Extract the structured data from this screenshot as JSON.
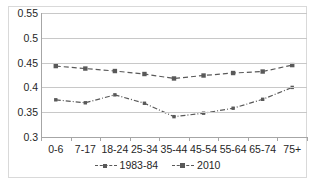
{
  "chart_data": {
    "type": "line",
    "title": "",
    "subtitle": "",
    "xlabel": "",
    "ylabel": "",
    "categories": [
      "0-6",
      "7-17",
      "18-24",
      "25-34",
      "35-44",
      "45-54",
      "55-64",
      "65-74",
      "75+"
    ],
    "series": [
      {
        "name": "1983-84",
        "values": [
          0.375,
          0.369,
          0.385,
          0.368,
          0.341,
          0.348,
          0.358,
          0.376,
          0.4
        ],
        "line_style": "dash-dot",
        "marker": "small-square",
        "color": "#595959"
      },
      {
        "name": "2010",
        "values": [
          0.443,
          0.438,
          0.433,
          0.427,
          0.418,
          0.424,
          0.429,
          0.432,
          0.445
        ],
        "line_style": "dashed",
        "marker": "square",
        "color": "#595959"
      }
    ],
    "ylim": [
      0.3,
      0.55
    ],
    "yticks": [
      0.3,
      0.35,
      0.4,
      0.45,
      0.5,
      0.55
    ],
    "ytick_labels": [
      "0.3",
      "0.35",
      "0.4",
      "0.45",
      "0.5",
      "0.55"
    ],
    "grid": true,
    "grid_axis": "y",
    "legend_position": "bottom",
    "legend_entries": [
      "1983-84",
      "2010"
    ],
    "colors": {
      "series": "#595959",
      "gridline": "#c8c8c8",
      "axis": "#a6a6a6",
      "text": "#262626",
      "frame": "#d9d9d9",
      "background": "#ffffff"
    }
  }
}
